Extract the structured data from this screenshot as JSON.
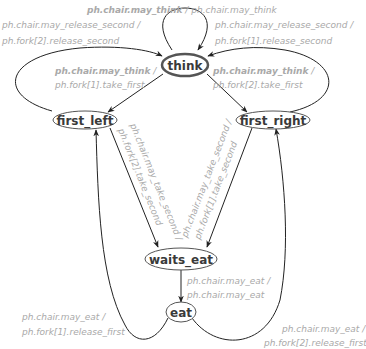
{
  "diagram": {
    "type": "state-machine",
    "nodes": {
      "think": "think",
      "first_left": "first_left",
      "first_right": "first_right",
      "waits_eat": "waits_eat",
      "eat": "eat"
    },
    "edges": {
      "think_self": {
        "guard": "ph.chair.may_think",
        "sep": " / ",
        "action": "ph.chair.may_think"
      },
      "first_left_to_think": {
        "guard": "ph.chair.may_release_second /",
        "action": "ph.fork[2].release_second"
      },
      "first_right_to_think": {
        "guard": "ph.chair.may_release_second /",
        "action": "ph.fork[1].release_second"
      },
      "think_to_first_left": {
        "guard": "ph.chair.may_think",
        "sep": " /",
        "action": "ph.fork[1].take_first"
      },
      "think_to_first_right": {
        "guard": "ph.chair.may_think",
        "sep": " /",
        "action": "ph.fork[2].take_first"
      },
      "first_left_to_waits_eat": {
        "guard": "ph.chair.may_take_second /",
        "action": "ph.fork[2].take_second"
      },
      "first_right_to_waits_eat": {
        "guard": "ph.chair.may_take_second /",
        "action": "ph.fork[1].take_second"
      },
      "waits_eat_to_eat": {
        "guard": "ph.chair.may_eat /",
        "action": "ph.chair.may_eat"
      },
      "eat_to_first_left": {
        "guard": "ph.chair.may_eat /",
        "action": "ph.fork[1].release_first"
      },
      "eat_to_first_right": {
        "guard": "ph.chair.may_eat /",
        "action": "ph.fork[2].release_first"
      }
    }
  }
}
